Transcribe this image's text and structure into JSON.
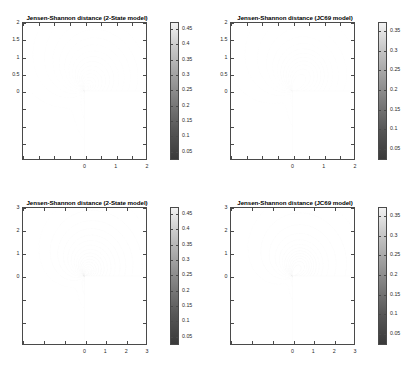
{
  "figure": {
    "background": "#ffffff",
    "grid": "2x2",
    "colormap": "grayscale"
  },
  "panels": [
    {
      "id": "top-left",
      "title": "Jensen-Shannon distance (2-State model)",
      "model": "2-State",
      "xticks": [
        "0",
        "1",
        "2"
      ],
      "yticks": [
        "0",
        "0.5",
        "1",
        "1.5",
        "2"
      ],
      "cbticks": [
        "0.05",
        "0.1",
        "0.15",
        "0.2",
        "0.25",
        "0.3",
        "0.35",
        "0.4",
        "0.45"
      ]
    },
    {
      "id": "top-right",
      "title": "Jensen-Shannon distance (JC69 model)",
      "model": "JC69",
      "xticks": [
        "0",
        "1",
        "2"
      ],
      "yticks": [
        "0",
        "0.5",
        "1",
        "1.5",
        "2"
      ],
      "cbticks": [
        "0.05",
        "0.1",
        "0.15",
        "0.2",
        "0.25",
        "0.3",
        "0.35"
      ]
    },
    {
      "id": "bottom-left",
      "title": "Jensen-Shannon distance (2-State model)",
      "model": "2-State",
      "xticks": [
        "0",
        "1",
        "2",
        "3"
      ],
      "yticks": [
        "0",
        "1",
        "2",
        "3"
      ],
      "cbticks": [
        "0.05",
        "0.1",
        "0.15",
        "0.2",
        "0.25",
        "0.3",
        "0.35",
        "0.4",
        "0.45"
      ]
    },
    {
      "id": "bottom-right",
      "title": "Jensen-Shannon distance (JC69 model)",
      "model": "JC69",
      "xticks": [
        "0",
        "1",
        "2",
        "3"
      ],
      "yticks": [
        "0",
        "1",
        "2",
        "3"
      ],
      "cbticks": [
        "0.05",
        "0.1",
        "0.15",
        "0.2",
        "0.25",
        "0.3",
        "0.35"
      ]
    }
  ],
  "chart_data": [
    {
      "type": "contour",
      "panel": "top-left",
      "title": "Jensen-Shannon distance (2-State model)",
      "xlabel": "",
      "ylabel": "",
      "xlim": [
        -2,
        2
      ],
      "ylim": [
        -2,
        2
      ],
      "xticks": [
        0,
        1,
        2
      ],
      "yticks": [
        0,
        0.5,
        1,
        1.5,
        2
      ],
      "grid": false,
      "colorbar": {
        "position": "right",
        "ticks": [
          0.05,
          0.1,
          0.15,
          0.2,
          0.25,
          0.3,
          0.35,
          0.4,
          0.45
        ],
        "vmin": 0.02,
        "vmax": 0.47,
        "colormap": "gray"
      },
      "contour_levels": [
        0.05,
        0.075,
        0.1,
        0.125,
        0.15,
        0.175,
        0.2,
        0.225,
        0.25,
        0.275,
        0.3,
        0.325,
        0.35,
        0.375,
        0.4,
        0.425,
        0.45
      ],
      "singularity": [
        0,
        0
      ],
      "notes": "Contours fan out from the origin; the lower-right quadrant (x>0, y<0) is blank/undefined."
    },
    {
      "type": "contour",
      "panel": "top-right",
      "title": "Jensen-Shannon distance (JC69 model)",
      "xlabel": "",
      "ylabel": "",
      "xlim": [
        -2,
        2
      ],
      "ylim": [
        -2,
        2
      ],
      "xticks": [
        0,
        1,
        2
      ],
      "yticks": [
        0,
        0.5,
        1,
        1.5,
        2
      ],
      "grid": false,
      "colorbar": {
        "position": "right",
        "ticks": [
          0.05,
          0.1,
          0.15,
          0.2,
          0.25,
          0.3,
          0.35
        ],
        "vmin": 0.02,
        "vmax": 0.37,
        "colormap": "gray"
      },
      "contour_levels": [
        0.05,
        0.075,
        0.1,
        0.125,
        0.15,
        0.175,
        0.2,
        0.225,
        0.25,
        0.275,
        0.3,
        0.325,
        0.35
      ],
      "singularity": [
        0,
        0
      ],
      "notes": "Contours converge on the origin; lower-right quadrant blank."
    },
    {
      "type": "contour",
      "panel": "bottom-left",
      "title": "Jensen-Shannon distance (2-State model)",
      "xlabel": "",
      "ylabel": "",
      "xlim": [
        -3,
        3
      ],
      "ylim": [
        -3,
        3
      ],
      "xticks": [
        0,
        1,
        2,
        3
      ],
      "yticks": [
        0,
        1,
        2,
        3
      ],
      "grid": false,
      "colorbar": {
        "position": "right",
        "ticks": [
          0.05,
          0.1,
          0.15,
          0.2,
          0.25,
          0.3,
          0.35,
          0.4,
          0.45
        ],
        "vmin": 0.02,
        "vmax": 0.47,
        "colormap": "gray"
      },
      "contour_levels": [
        0.05,
        0.075,
        0.1,
        0.125,
        0.15,
        0.175,
        0.2,
        0.225,
        0.25,
        0.275,
        0.3,
        0.325,
        0.35,
        0.375,
        0.4,
        0.425,
        0.45
      ],
      "singularity": [
        0,
        0
      ],
      "local_max": [
        0.5,
        0.5
      ],
      "notes": "Wider view; closed contour loops form above the x-axis for x>0. Lower-right quadrant blank."
    },
    {
      "type": "contour",
      "panel": "bottom-right",
      "title": "Jensen-Shannon distance (JC69 model)",
      "xlabel": "",
      "ylabel": "",
      "xlim": [
        -3,
        3
      ],
      "ylim": [
        -3,
        3
      ],
      "xticks": [
        0,
        1,
        2,
        3
      ],
      "yticks": [
        0,
        1,
        2,
        3
      ],
      "grid": false,
      "colorbar": {
        "position": "right",
        "ticks": [
          0.05,
          0.1,
          0.15,
          0.2,
          0.25,
          0.3,
          0.35
        ],
        "vmin": 0.02,
        "vmax": 0.37,
        "colormap": "gray"
      },
      "contour_levels": [
        0.05,
        0.075,
        0.1,
        0.125,
        0.15,
        0.175,
        0.2,
        0.225,
        0.25,
        0.275,
        0.3,
        0.325,
        0.35
      ],
      "singularity": [
        0,
        0
      ],
      "local_max": [
        0.45,
        0.5
      ],
      "notes": "Concentric closed contours encircle a local maximum near (0.45, 0.5); lower-right quadrant blank."
    }
  ]
}
